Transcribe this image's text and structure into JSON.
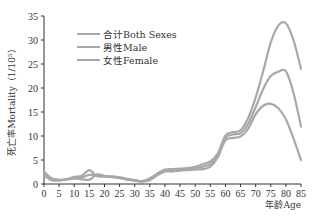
{
  "chart_data": {
    "type": "line",
    "title": "",
    "xlabel": "年龄Age",
    "ylabel": "死亡率Mortality（1/10⁵）",
    "ylim": [
      0,
      35
    ],
    "xlim": [
      0,
      85
    ],
    "grid": false,
    "legend_position": "upper-left",
    "x_ticks": [
      0,
      5,
      10,
      15,
      20,
      25,
      30,
      35,
      40,
      45,
      50,
      55,
      60,
      65,
      70,
      75,
      80,
      85
    ],
    "y_ticks": [
      0,
      5,
      10,
      15,
      20,
      25,
      30,
      35
    ],
    "x": [
      0,
      2.5,
      5,
      7.5,
      10,
      12.5,
      15,
      17.5,
      20,
      22.5,
      25,
      27.5,
      30,
      32.5,
      35,
      37.5,
      40,
      42.5,
      45,
      47.5,
      50,
      52.5,
      55,
      57.5,
      60,
      62.5,
      65,
      67.5,
      70,
      72.5,
      75,
      77.5,
      80,
      82.5,
      85
    ],
    "series": [
      {
        "name": "合计Both Sexes",
        "color": "#a8a8a8",
        "values": [
          2.2,
          1.0,
          0.8,
          1.0,
          1.3,
          1.4,
          1.9,
          1.8,
          1.6,
          1.5,
          1.3,
          1.0,
          0.8,
          0.6,
          1.0,
          2.0,
          2.8,
          2.9,
          3.0,
          3.1,
          3.3,
          3.6,
          4.2,
          6.0,
          9.6,
          10.3,
          10.6,
          12.5,
          16.0,
          19.8,
          22.5,
          23.4,
          23.5,
          19.0,
          12.0
        ]
      },
      {
        "name": "男性Male",
        "color": "#a8a8a8",
        "values": [
          1.8,
          0.8,
          0.7,
          1.0,
          1.5,
          1.7,
          2.9,
          1.6,
          1.6,
          1.6,
          1.4,
          1.1,
          0.8,
          0.6,
          1.2,
          2.2,
          3.0,
          3.1,
          3.2,
          3.3,
          3.6,
          4.1,
          4.7,
          6.4,
          10.1,
          10.8,
          11.2,
          13.7,
          18.0,
          23.5,
          29.5,
          33.0,
          33.5,
          30.0,
          24.0
        ]
      },
      {
        "name": "女性Female",
        "color": "#a8a8a8",
        "values": [
          2.6,
          1.2,
          0.9,
          0.9,
          1.1,
          1.0,
          0.9,
          2.0,
          1.7,
          1.4,
          1.2,
          0.9,
          0.7,
          0.5,
          0.8,
          1.8,
          2.6,
          2.6,
          2.8,
          2.9,
          3.0,
          3.1,
          3.6,
          5.6,
          9.1,
          9.6,
          9.9,
          11.5,
          14.5,
          16.3,
          16.7,
          15.8,
          13.5,
          9.5,
          5.0
        ]
      }
    ],
    "legend": [
      "合计Both Sexes",
      "男性Male",
      "女性Female"
    ]
  }
}
